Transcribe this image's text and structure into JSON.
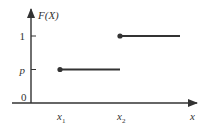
{
  "chart_data": {
    "type": "line",
    "title": "",
    "ylabel": "F(X)",
    "xlabel": "x",
    "x_ticks": [
      {
        "label": "x",
        "sub": "1",
        "value": 1
      },
      {
        "label": "x",
        "sub": "2",
        "value": 2
      }
    ],
    "y_ticks": [
      {
        "label": "p",
        "value": 0.5
      },
      {
        "label": "1",
        "value": 1
      }
    ],
    "origin_label": "0",
    "xlim": [
      0,
      3.3
    ],
    "ylim": [
      0,
      1.3
    ],
    "series": [
      {
        "name": "F(X) on [x1, x2)",
        "x": [
          1,
          2
        ],
        "y": [
          0.5,
          0.5
        ],
        "closed_start": true
      },
      {
        "name": "F(X) on [x2, ∞)",
        "x": [
          2,
          3
        ],
        "y": [
          1,
          1
        ],
        "closed_start": true
      }
    ],
    "colors": {
      "axis": "#333333",
      "line": "#333333"
    }
  }
}
